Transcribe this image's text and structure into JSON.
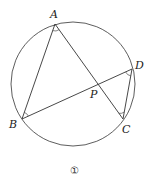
{
  "diagram": {
    "type": "geometry",
    "circle": {
      "cx": 73,
      "cy": 84,
      "r": 62
    },
    "points": {
      "A": {
        "label": "A",
        "x": 55,
        "y": 24
      },
      "B": {
        "label": "B",
        "x": 22,
        "y": 119
      },
      "C": {
        "label": "C",
        "x": 123,
        "y": 119
      },
      "D": {
        "label": "D",
        "x": 132,
        "y": 69
      },
      "P": {
        "label": "P",
        "x": 96,
        "y": 83
      }
    },
    "segments": [
      "AB",
      "AC",
      "BD",
      "DC"
    ],
    "angle_marks": [
      "A",
      "B",
      "C",
      "D"
    ],
    "caption": "①"
  },
  "colors": {
    "stroke": "#333333",
    "text": "#222222",
    "background": "#ffffff"
  }
}
